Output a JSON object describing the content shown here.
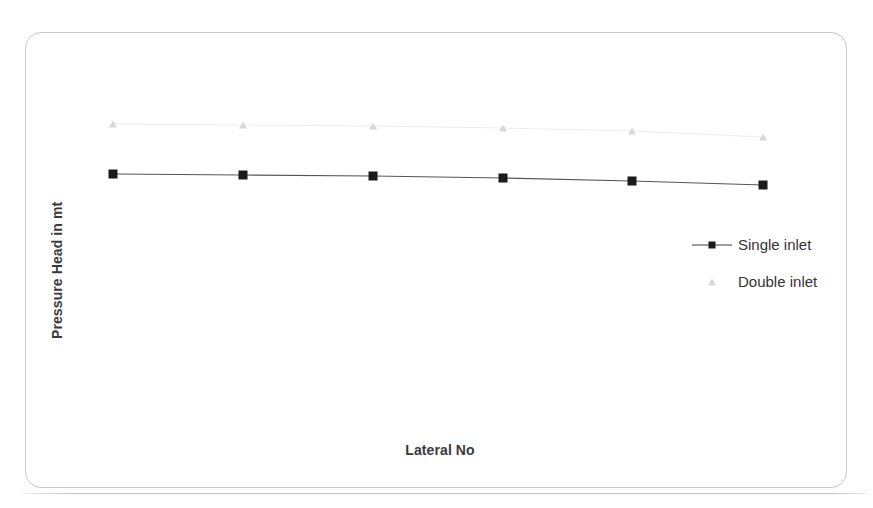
{
  "figure": {
    "background_color": "#ffffff",
    "frame_color": "#c9c9c9"
  },
  "axes": {
    "x_title": "Lateral No",
    "y_title": "Pressure Head in mt"
  },
  "legend": {
    "entries": [
      {
        "label": "Single inlet",
        "marker": "square",
        "color": "#1a1a1a",
        "has_line": true
      },
      {
        "label": "Double inlet",
        "marker": "triangle",
        "color": "#d8d8d8",
        "has_line": false
      }
    ]
  },
  "chart_data": {
    "type": "line",
    "title": "",
    "xlabel": "Lateral No",
    "ylabel": "Pressure Head in mt",
    "categories": [
      1,
      2,
      3,
      4,
      5,
      6
    ],
    "x": [
      1,
      2,
      3,
      4,
      5,
      6
    ],
    "xlim": [
      0.6,
      6.4
    ],
    "ylim": [
      0,
      10
    ],
    "grid": false,
    "axis_ticks_visible": false,
    "legend_position": "right",
    "series": [
      {
        "name": "Single inlet",
        "marker": "square",
        "color": "#1a1a1a",
        "line": true,
        "values": [
          6.15,
          6.1,
          6.05,
          5.97,
          5.88,
          5.72
        ]
      },
      {
        "name": "Double inlet",
        "marker": "triangle",
        "color": "#d8d8d8",
        "line": true,
        "values": [
          7.38,
          7.35,
          7.32,
          7.27,
          7.22,
          7.13
        ]
      }
    ]
  },
  "plot_pixels": {
    "single_inlet": [
      {
        "x": 113,
        "y": 174
      },
      {
        "x": 243,
        "y": 175
      },
      {
        "x": 373,
        "y": 176
      },
      {
        "x": 503,
        "y": 178
      },
      {
        "x": 632,
        "y": 181
      },
      {
        "x": 763,
        "y": 185
      }
    ],
    "double_inlet": [
      {
        "x": 113,
        "y": 124
      },
      {
        "x": 243,
        "y": 125
      },
      {
        "x": 373,
        "y": 126
      },
      {
        "x": 503,
        "y": 128
      },
      {
        "x": 632,
        "y": 131
      },
      {
        "x": 763,
        "y": 137
      }
    ]
  }
}
